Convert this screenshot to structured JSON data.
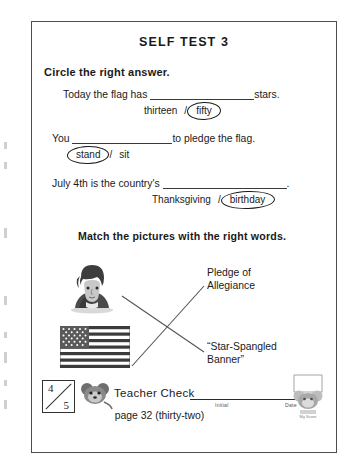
{
  "page": {
    "title": "SELF TEST 3",
    "page_number_text": "page 32 (thirty-two)"
  },
  "sections": {
    "circle": {
      "heading": "Circle the right answer.",
      "questions": [
        {
          "text_before": "Today the flag has",
          "text_after": "stars.",
          "option_a": "thirteen",
          "separator": "/",
          "option_b": "fifty",
          "circled": "fifty"
        },
        {
          "text_before": "You",
          "text_after": "to pledge the flag.",
          "option_a": "stand",
          "separator": "/",
          "option_b": "sit",
          "circled": "stand"
        },
        {
          "text_before": "July 4th is the country's",
          "text_after": ".",
          "option_a": "Thanksgiving",
          "separator": "/",
          "option_b": "birthday",
          "circled": "birthday"
        }
      ]
    },
    "match": {
      "heading": "Match the pictures with the right words.",
      "pictures": [
        {
          "name": "portrait-illustration",
          "alt": "man portrait"
        },
        {
          "name": "flag-illustration",
          "alt": "United States flag"
        }
      ],
      "words": [
        "Pledge of\nAllegiance",
        "“Star-Spangled\nBanner”"
      ]
    }
  },
  "footer": {
    "score_numerator": "4",
    "score_denominator": "5",
    "teacher_check_label": "Teacher Check",
    "initial_label": "Initial",
    "date_label": "Date",
    "mascot_caption": "My Score"
  },
  "colors": {
    "ink": "#1a1a1a",
    "border": "#4d4d4d",
    "rule": "#3a3a3a"
  }
}
